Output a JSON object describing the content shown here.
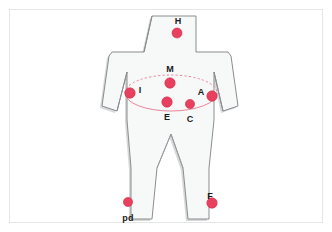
{
  "figure": {
    "body_fill": "#f7f8f8",
    "body_stroke": "#8a8d8f",
    "shadow_color": "#c9cbcc",
    "background": "#ffffff",
    "frame_color": "#e6e6e6",
    "marker_color": "#e8405f",
    "marker_stroke": "#d72847",
    "ellipse_color": "#e8859a",
    "label_color": "#1a1a1a"
  },
  "markers": [
    {
      "id": "H",
      "label": "H",
      "x": 177,
      "y": 33,
      "r": 5.0,
      "label_x": 178,
      "label_y": 17,
      "region": "head"
    },
    {
      "id": "M",
      "label": "M",
      "x": 170,
      "y": 83,
      "r": 5.2,
      "label_x": 170,
      "label_y": 65,
      "region": "upper-chest"
    },
    {
      "id": "I",
      "label": "I",
      "x": 130,
      "y": 93,
      "r": 5.2,
      "label_x": 140,
      "label_y": 86,
      "region": "left-side"
    },
    {
      "id": "A",
      "label": "A",
      "x": 212,
      "y": 96,
      "r": 5.2,
      "label_x": 201,
      "label_y": 88,
      "region": "right-side"
    },
    {
      "id": "E",
      "label": "E",
      "x": 167,
      "y": 102,
      "r": 5.2,
      "label_x": 167,
      "label_y": 113,
      "region": "lower-chest-left"
    },
    {
      "id": "C",
      "label": "C",
      "x": 190,
      "y": 104,
      "r": 4.6,
      "label_x": 190,
      "label_y": 115,
      "region": "lower-chest-right"
    },
    {
      "id": "pd",
      "label": "pd",
      "x": 128,
      "y": 202,
      "r": 4.6,
      "label_x": 128,
      "label_y": 214,
      "region": "left-leg-lower"
    },
    {
      "id": "F",
      "label": "F",
      "x": 212,
      "y": 203,
      "r": 5.2,
      "label_x": 210,
      "label_y": 192,
      "region": "right-leg-lower"
    }
  ],
  "ellipse": {
    "cx": 171,
    "cy": 93,
    "rx": 46,
    "ry": 18,
    "upper_style": "dashed",
    "lower_style": "solid"
  },
  "body_outline": "M 152 16 L 196 16 L 196 52 L 228 52 L 231 56 L 238 106 L 223 111 L 214 72 L 214 120 L 209 168 L 209 219 L 188 219 L 183 168 L 171 134 L 157 168 L 152 219 L 131 219 L 131 168 L 127 120 L 127 72 L 117 111 L 102 106 L 109 56 L 112 52 L 144 52 L 144 52 Z"
}
